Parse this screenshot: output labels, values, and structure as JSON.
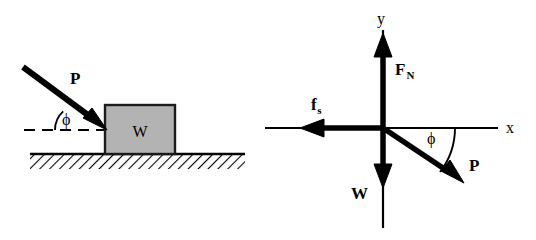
{
  "figure": {
    "background_color": "#ffffff",
    "stroke_color": "#000000",
    "block_fill_color": "#b3b3b3",
    "block_border_color": "#1a1a1a"
  },
  "left_panel": {
    "name": "physical-situation",
    "block_label": "W",
    "applied_force_label": "P",
    "angle_label": "ϕ",
    "ground_name": "hatched-ground",
    "reference_line_name": "dashed-horizontal-reference"
  },
  "right_panel": {
    "name": "free-body-diagram",
    "axis_x_label": "x",
    "axis_y_label": "y",
    "normal_force_base": "F",
    "normal_force_sub": "N",
    "friction_force_base": "f",
    "friction_force_sub": "s",
    "weight_label": "W",
    "applied_force_label": "P",
    "angle_label": "ϕ"
  }
}
